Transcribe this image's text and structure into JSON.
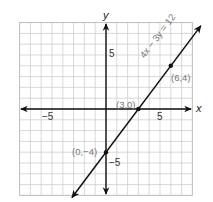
{
  "chart_data": {
    "type": "line",
    "title": "",
    "xlabel": "x",
    "ylabel": "y",
    "xlim": [
      -8,
      8
    ],
    "ylim": [
      -8,
      8
    ],
    "grid": true,
    "x_tick_labels": [
      "-5",
      "5"
    ],
    "y_tick_labels": [
      "5",
      "-5"
    ],
    "series": [
      {
        "name": "4x - 3y = 12",
        "equation": "4x − 3y = 12",
        "points": [
          {
            "x": 0,
            "y": -4,
            "label": "(0,−4)"
          },
          {
            "x": 3,
            "y": 0,
            "label": "(3,0)"
          },
          {
            "x": 6,
            "y": 4,
            "label": "(6,4)"
          }
        ]
      }
    ]
  },
  "labels": {
    "x_axis": "x",
    "y_axis": "y",
    "x_neg5": "−5",
    "x_pos5": "5",
    "y_pos5": "5",
    "y_neg5": "−5",
    "equation": "4x − 3y = 12",
    "p1": "(0,−4)",
    "p2": "(3,0)",
    "p3": "(6,4)"
  }
}
